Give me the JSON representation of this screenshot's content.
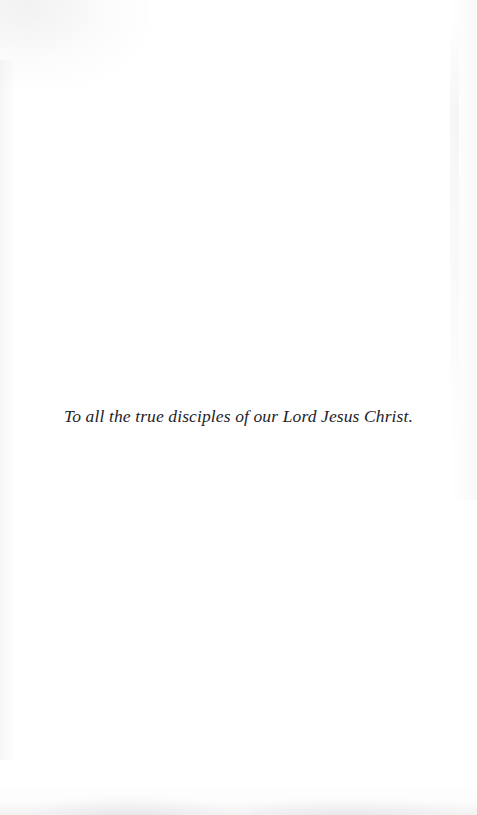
{
  "page": {
    "type": "book-dedication-page",
    "background_color": "#ffffff",
    "text_color": "#23232a"
  },
  "dedication": {
    "text": "To all the true disciples of our Lord Jesus Christ."
  }
}
